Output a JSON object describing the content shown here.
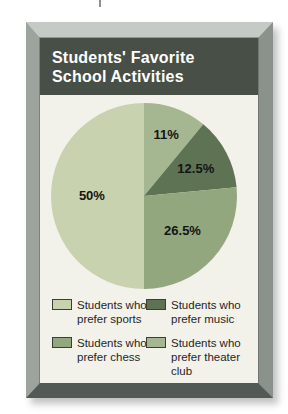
{
  "poster": {
    "title_line1": "Students' Favorite",
    "title_line2": "School Activities",
    "header_bg": "#474f46",
    "panel_bg": "#f2f1ea"
  },
  "chart_data": {
    "type": "pie",
    "title": "Students' Favorite School Activities",
    "start_angle_deg": 0,
    "direction": "clockwise",
    "legend_position": "bottom",
    "slices": [
      {
        "label": "Students who prefer theater club",
        "value": 11,
        "pct_label": "11%",
        "color": "#a4b790",
        "label_r": 0.7
      },
      {
        "label": "Students who prefer music",
        "value": 12.5,
        "pct_label": "12.5%",
        "color": "#5e7354",
        "label_r": 0.63
      },
      {
        "label": "Students who prefer chess",
        "value": 26.5,
        "pct_label": "26.5%",
        "color": "#93a77f",
        "label_r": 0.56
      },
      {
        "label": "Students who prefer sports",
        "value": 50,
        "pct_label": "50%",
        "color": "#c8d2ae",
        "label_r": 0.56
      }
    ]
  },
  "legend": {
    "items": [
      {
        "label": "Students who prefer sports",
        "color": "#c8d2ae"
      },
      {
        "label": "Students who prefer music",
        "color": "#5e7354"
      },
      {
        "label": "Students who prefer chess",
        "color": "#93a77f"
      },
      {
        "label": "Students who prefer theater club",
        "color": "#a4b790"
      }
    ]
  }
}
